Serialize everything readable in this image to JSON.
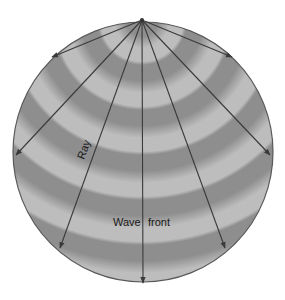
{
  "diagram": {
    "type": "wave-propagation",
    "source": {
      "x": 142,
      "y": 20
    },
    "sphere": {
      "cx": 143,
      "cy": 152,
      "r": 130,
      "edge_color": "#5a5a5a"
    },
    "bands": {
      "dark_color": "#8e8e8e",
      "light_color": "#bdbdbd",
      "period": 45,
      "count": 7
    },
    "rays": [
      {
        "x2": 52,
        "y2": 57
      },
      {
        "x2": 16,
        "y2": 155
      },
      {
        "x2": 60,
        "y2": 248
      },
      {
        "x2": 143,
        "y2": 283
      },
      {
        "x2": 225,
        "y2": 248
      },
      {
        "x2": 270,
        "y2": 155
      },
      {
        "x2": 232,
        "y2": 57
      }
    ],
    "ray_color": "#3a3a3a",
    "labels": {
      "ray": "Ray",
      "wave": "Wave",
      "front": "front"
    }
  }
}
